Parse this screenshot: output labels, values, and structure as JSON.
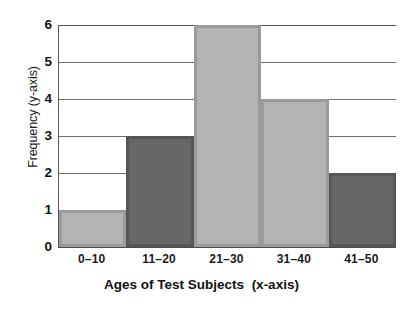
{
  "chart_data": {
    "type": "bar",
    "title": "",
    "categories": [
      "0–10",
      "11–20",
      "21–30",
      "31–40",
      "41–50"
    ],
    "values": [
      1,
      3,
      6,
      4,
      2
    ],
    "xlabel": "Ages of Test Subjects",
    "xlabel_suffix": "(x-axis)",
    "ylabel": "Frequency  (y-axis)",
    "ylim": [
      0,
      6
    ],
    "yticks": [
      0,
      1,
      2,
      3,
      4,
      5,
      6
    ],
    "ytick_labels": [
      "0",
      "1",
      "2",
      "3",
      "4",
      "5",
      "6"
    ],
    "grid": true,
    "grid_axis": "y",
    "legend": null,
    "bar_colors": [
      "#b3b3b3",
      "#676767",
      "#b3b3b3",
      "#b3b3b3",
      "#676767"
    ],
    "bar_edge_colors": [
      "#9a9a9a",
      "#565656",
      "#9a9a9a",
      "#9a9a9a",
      "#565656"
    ],
    "background_color": "#ffffff",
    "axis_color": "#555555",
    "gridline_color": "#6e6e6e",
    "text_color": "#111111"
  }
}
